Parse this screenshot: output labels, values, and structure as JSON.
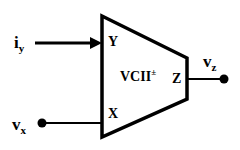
{
  "diagram": {
    "block": {
      "label": "VCII",
      "superscript": "±"
    },
    "ports": {
      "y": "Y",
      "x": "X",
      "z": "Z"
    },
    "signals": {
      "iy": {
        "main": "i",
        "sub": "y"
      },
      "vx": {
        "main": "v",
        "sub": "x"
      },
      "vz": {
        "main": "v",
        "sub": "z"
      }
    },
    "colors": {
      "stroke": "#000000",
      "background": "#ffffff"
    }
  }
}
